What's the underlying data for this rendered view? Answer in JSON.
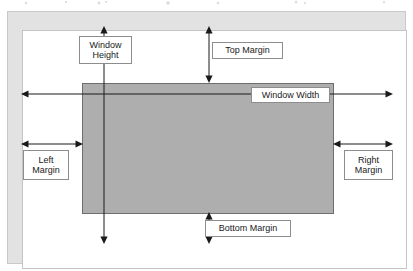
{
  "diagram": {
    "colors": {
      "page_frame_band": "#e2e2e2",
      "page_frame_border": "#c9c9c9",
      "page_interior": "#ffffff",
      "window_fill": "#aeaeae",
      "window_border": "#6e6e6e",
      "label_border": "#8d8d8d",
      "label_fill": "#ffffff",
      "line": "#1a1a1a",
      "text": "#1a1a1a"
    },
    "shapes": {
      "page_frame_label": "page-frame",
      "page_interior_label": "page-interior",
      "window_label": "window-rectangle"
    },
    "labels": {
      "window_height_line1": "Window",
      "window_height_line2": "Height",
      "top_margin": "Top Margin",
      "window_width": "Window Width",
      "left_margin_line1": "Left",
      "left_margin_line2": "Margin",
      "right_margin_line1": "Right",
      "right_margin_line2": "Margin",
      "bottom_margin": "Bottom Margin"
    },
    "measures": [
      {
        "name": "window-height",
        "orientation": "vertical",
        "x": 104,
        "from": 27,
        "to": 243,
        "arrowheads": "both"
      },
      {
        "name": "top-margin",
        "orientation": "vertical",
        "x": 209,
        "from": 27,
        "to": 82,
        "arrowheads": "both"
      },
      {
        "name": "bottom-margin",
        "orientation": "vertical",
        "x": 209,
        "from": 213,
        "to": 243,
        "arrowheads": "both"
      },
      {
        "name": "window-width",
        "orientation": "horizontal",
        "y": 94,
        "from": 22,
        "to": 392,
        "arrowheads": "both"
      },
      {
        "name": "left-margin",
        "orientation": "horizontal",
        "y": 144,
        "from": 22,
        "to": 82,
        "arrowheads": "both"
      },
      {
        "name": "right-margin",
        "orientation": "horizontal",
        "y": 144,
        "from": 333,
        "to": 392,
        "arrowheads": "both"
      }
    ]
  }
}
